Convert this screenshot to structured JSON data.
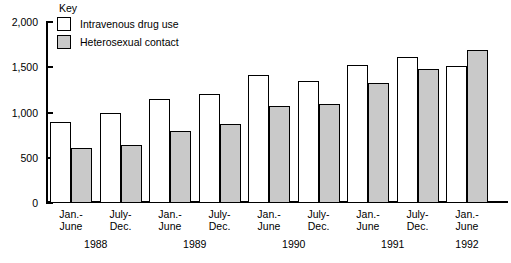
{
  "chart_data": {
    "type": "bar",
    "title": "",
    "xlabel": "",
    "ylabel": "",
    "ylim": [
      0,
      2000
    ],
    "yticks": [
      0,
      500,
      1000,
      1500,
      2000
    ],
    "ytick_labels": [
      "0",
      "500",
      "1,000",
      "1,500",
      "2,000"
    ],
    "grid": false,
    "legend_position": "top-left",
    "legend_title": "Key",
    "categories": [
      "Jan.-June 1988",
      "July-Dec. 1988",
      "Jan.-June 1989",
      "July-Dec. 1989",
      "Jan.-June 1990",
      "July-Dec. 1990",
      "Jan.-June 1991",
      "July-Dec. 1991",
      "Jan.-June 1992"
    ],
    "periods": [
      {
        "period_line1": "Jan.-",
        "period_line2": "June",
        "year": "1988"
      },
      {
        "period_line1": "July-",
        "period_line2": "Dec.",
        "year": ""
      },
      {
        "period_line1": "Jan.-",
        "period_line2": "June",
        "year": "1989"
      },
      {
        "period_line1": "July-",
        "period_line2": "Dec.",
        "year": ""
      },
      {
        "period_line1": "Jan.-",
        "period_line2": "June",
        "year": "1990"
      },
      {
        "period_line1": "July-",
        "period_line2": "Dec.",
        "year": ""
      },
      {
        "period_line1": "Jan.-",
        "period_line2": "June",
        "year": "1991"
      },
      {
        "period_line1": "July-",
        "period_line2": "Dec.",
        "year": ""
      },
      {
        "period_line1": "Jan.-",
        "period_line2": "June",
        "year": "1992"
      }
    ],
    "year_groups": [
      {
        "year": "1988",
        "center_index": 0.5
      },
      {
        "year": "1989",
        "center_index": 2.5
      },
      {
        "year": "1990",
        "center_index": 4.5
      },
      {
        "year": "1991",
        "center_index": 6.5
      },
      {
        "year": "1992",
        "center_index": 8.0
      }
    ],
    "series": [
      {
        "name": "Intravenous drug use",
        "color": "#ffffff",
        "values": [
          900,
          990,
          1150,
          1200,
          1420,
          1350,
          1530,
          1610,
          1510
        ]
      },
      {
        "name": "Heterosexual contact",
        "color": "#c9c9c9",
        "values": [
          610,
          640,
          800,
          870,
          1070,
          1090,
          1330,
          1480,
          1690
        ]
      }
    ]
  }
}
